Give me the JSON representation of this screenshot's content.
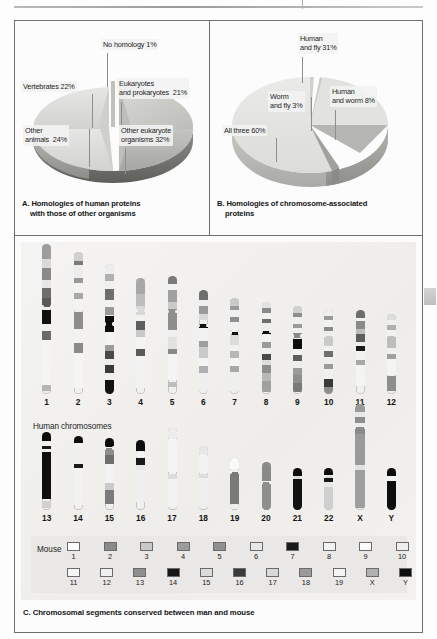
{
  "figure": {
    "top_rule": true,
    "panels": [
      "A",
      "B",
      "C"
    ]
  },
  "panel_a": {
    "caption_line1": "A. Homologies of human proteins",
    "caption_line2": "with those of other organisms",
    "labels": [
      {
        "text": "No homology 1%"
      },
      {
        "text": "Vertebrates 22%"
      },
      {
        "text": "Eukaryotes\nand prokaryotes  21%"
      },
      {
        "text": "Other\nanimals  24%"
      },
      {
        "text": "Other eukaryote\norganisms 32%"
      }
    ]
  },
  "panel_b": {
    "caption_line1": "B. Homologies of chromosome-associated",
    "caption_line2": "proteins",
    "labels": [
      {
        "text": "Human\nand fly 31%"
      },
      {
        "text": "Human\nand worm 8%"
      },
      {
        "text": "Worm\nand fly 3%"
      },
      {
        "text": "All three 60%"
      }
    ]
  },
  "panel_c": {
    "caption": "C. Chromosomal segments conserved between man and mouse",
    "human_label": "Human chromosomes",
    "mouse_label": "Mouse",
    "row1_numbers": [
      "1",
      "2",
      "3",
      "4",
      "5",
      "6",
      "7",
      "8",
      "9",
      "10",
      "11",
      "12"
    ],
    "row2_numbers": [
      "13",
      "14",
      "15",
      "16",
      "17",
      "18",
      "19",
      "20",
      "21",
      "22",
      "X",
      "Y"
    ],
    "mouse_row1": [
      "1",
      "2",
      "3",
      "4",
      "5",
      "6",
      "7",
      "8",
      "9",
      "10"
    ],
    "mouse_row2": [
      "11",
      "12",
      "13",
      "14",
      "15",
      "16",
      "17",
      "18",
      "19",
      "X",
      "Y"
    ],
    "mouse_row1_shades": [
      "#fdfdfd",
      "#8a8a8a",
      "#c8c8c8",
      "#9b9b9b",
      "#8f8f8f",
      "#e8e8e8",
      "#1a1a1a",
      "#f2f2f2",
      "#fbfbfb",
      "#eeeeee"
    ],
    "mouse_row2_shades": [
      "#f7f7f7",
      "#efefef",
      "#8e8e8e",
      "#161616",
      "#dcdcdc",
      "#3a3a3a",
      "#d8d8d8",
      "#9a9a9a",
      "#f4f4f4",
      "#b0b0b0",
      "#101010"
    ]
  },
  "colors": {
    "frame": "#6f6f6f",
    "panel_c_bg": "#f2f1ef",
    "pie_light": "#e3e3e1",
    "pie_mid": "#c9c9c6",
    "pie_dark": "#9a9a97",
    "pie_darkest": "#6d6d6a",
    "label_chip": "#f3f3f3",
    "leader": "#8e8e8e",
    "edge_tab": "#cfcfcf"
  },
  "chart_data": [
    {
      "type": "pie",
      "title": "A. Homologies of human proteins with those of other organisms",
      "categories": [
        "No homology",
        "Eukaryotes and prokaryotes",
        "Other eukaryote organisms",
        "Other animals",
        "Vertebrates"
      ],
      "values": [
        1,
        21,
        32,
        24,
        22
      ],
      "unit": "%",
      "labels": [
        "No homology 1%",
        "Eukaryotes and prokaryotes  21%",
        "Other eukaryote organisms 32%",
        "Other animals  24%",
        "Vertebrates 22%"
      ],
      "legend": "labels-with-leader-lines",
      "notes": "3D pie drawn in low-angle perspective with the top wedge exploded/cut away"
    },
    {
      "type": "pie",
      "title": "B. Homologies of chromosome-associated proteins",
      "categories": [
        "All three",
        "Human and fly",
        "Human and worm",
        "Worm and fly"
      ],
      "values": [
        60,
        31,
        8,
        3
      ],
      "unit": "%",
      "labels": [
        "All three 60%",
        "Human and fly 31%",
        "Human and worm 8%",
        "Worm and fly 3%"
      ],
      "legend": "labels-with-leader-lines",
      "notes": "3D pie with a wedge removed at the upper-left"
    },
    {
      "type": "diagram",
      "title": "C. Chromosomal segments conserved between man and mouse",
      "x": [
        "1",
        "2",
        "3",
        "4",
        "5",
        "6",
        "7",
        "8",
        "9",
        "10",
        "11",
        "12",
        "13",
        "14",
        "15",
        "16",
        "17",
        "18",
        "19",
        "20",
        "21",
        "22",
        "X",
        "Y"
      ],
      "notes": "Human chromosome ideograms with G-banding; mouse chromosome key 1-19, X, Y shown as shaded squares"
    }
  ]
}
